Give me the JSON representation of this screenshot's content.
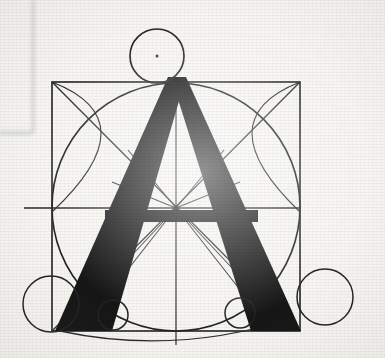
{
  "image": {
    "kind": "scanned-book-plate",
    "subject": "Geometric construction diagram of the capital letter A",
    "letter": "A",
    "background_color": "#f6f5f2",
    "ink_color": "#1a1a1a",
    "construction_line_color": "#2a2a2a",
    "faint_margin_color": "#e3e3e1",
    "width": 385,
    "height": 358
  },
  "margin_marks": {
    "vertical_rule": {
      "x": 33,
      "y_top": 0,
      "y_bottom": 134,
      "color": "#e0e0de"
    },
    "horizontal_rule": {
      "y": 133,
      "x_left": 0,
      "x_right": 33,
      "color": "#dedede"
    }
  },
  "geometry": {
    "square": {
      "name": "bounding-square",
      "x": 52,
      "y": 82,
      "width": 248,
      "height": 249,
      "stroke": "#242424",
      "stroke_width": 1.6
    },
    "inscribed_circle": {
      "name": "inscribed-circle",
      "cx": 176,
      "cy": 207,
      "r": 124,
      "stroke": "#242424",
      "stroke_width": 1.6
    },
    "apex_circle": {
      "name": "apex-circle",
      "cx": 157,
      "cy": 56,
      "r": 27,
      "stroke": "#242424",
      "stroke_width": 1.7
    },
    "foot_circles": [
      {
        "name": "bottom-left-large-circle",
        "cx": 51,
        "cy": 304,
        "r": 28
      },
      {
        "name": "bottom-right-large-circle",
        "cx": 325,
        "cy": 297,
        "r": 28
      },
      {
        "name": "bottom-left-small-circle",
        "cx": 113,
        "cy": 315,
        "r": 15
      },
      {
        "name": "bottom-right-small-circle",
        "cx": 240,
        "cy": 313,
        "r": 15
      }
    ],
    "center_point": {
      "cx": 176,
      "cy": 208,
      "r": 2.4
    },
    "diagonals": [
      {
        "name": "diagonal-tl-br",
        "x1": 52,
        "y1": 82,
        "x2": 300,
        "y2": 331
      },
      {
        "name": "diagonal-tr-bl",
        "x1": 300,
        "y1": 82,
        "x2": 52,
        "y2": 331
      }
    ],
    "axes": [
      {
        "name": "vertical-centerline",
        "x1": 176,
        "y1": 82,
        "x2": 176,
        "y2": 345
      },
      {
        "name": "horizontal-midline",
        "x1": 24,
        "y1": 208,
        "x2": 300,
        "y2": 208
      }
    ],
    "star_spokes": {
      "name": "center-star-spokes",
      "cx": 176,
      "cy": 208,
      "rays": [
        {
          "x": 128,
          "y": 150
        },
        {
          "x": 224,
          "y": 150
        },
        {
          "x": 112,
          "y": 182
        },
        {
          "x": 240,
          "y": 182
        },
        {
          "x": 120,
          "y": 268
        },
        {
          "x": 232,
          "y": 268
        },
        {
          "x": 104,
          "y": 300
        },
        {
          "x": 248,
          "y": 300
        }
      ]
    },
    "corner_arcs": [
      {
        "name": "arc-top-left-corner",
        "d": "M 52 82 Q 150 120 52 212"
      },
      {
        "name": "arc-top-right-corner",
        "d": "M 300 82 Q 204 120 300 212"
      }
    ],
    "baseline_arc": {
      "name": "baseline-sweep-arc",
      "d": "M 60 331 Q 176 356 292 318"
    },
    "letter_A": {
      "name": "letter-a-glyph",
      "apex": {
        "x": 172,
        "y": 77
      },
      "left_foot": {
        "x1": 55,
        "x2": 106,
        "y": 331
      },
      "right_foot": {
        "x1": 251,
        "x2": 301,
        "y": 331
      },
      "crossbar": {
        "x1": 105,
        "x2": 258,
        "y_top": 210,
        "y_bottom": 222
      },
      "left_stem_path": "M 168 77 L 186 77 L 112 331 L 55 331 Z",
      "right_stem_path": "M 171 77 L 186 77 L 301 331 L 251 331 Z",
      "fill": "#161616"
    }
  }
}
